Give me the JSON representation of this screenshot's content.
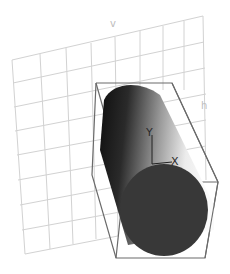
{
  "viewport": {
    "view_label": "3D viewport",
    "grid_label_v": "v",
    "grid_label_h": "h",
    "gizmo": {
      "y_axis_label": "Y",
      "x_axis_label": "X"
    }
  },
  "scene": {
    "object": "cylinder",
    "bounding_box": true,
    "grid_plane": true
  },
  "colors": {
    "background": "#ffffff",
    "grid": "#d0d0d0",
    "bbox": "#6a6a6a",
    "cylinder_dark": "#1a1a1a",
    "cylinder_light": "#f2f2f2",
    "cap": "#383838"
  }
}
